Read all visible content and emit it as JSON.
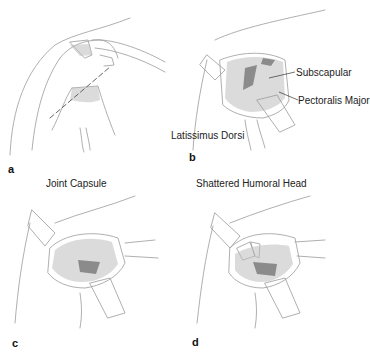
{
  "figure": {
    "panels": [
      {
        "letter": "a",
        "labels": []
      },
      {
        "letter": "b",
        "labels": [
          "Subscapular",
          "Pectoralis Major",
          "Latissimus Dorsi"
        ]
      },
      {
        "letter": "c",
        "labels": [
          "Joint Capsule"
        ]
      },
      {
        "letter": "d",
        "labels": [
          "Shattered Humoral Head"
        ]
      }
    ]
  }
}
